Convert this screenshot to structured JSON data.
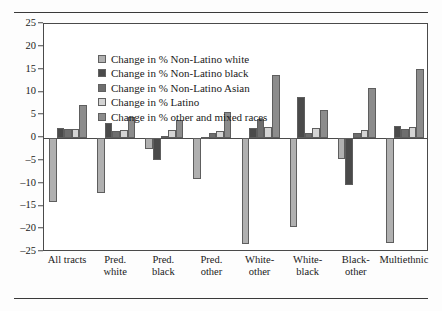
{
  "chart_data": {
    "type": "bar",
    "title": "",
    "xlabel": "",
    "ylabel": "",
    "ylim": [
      -25,
      25
    ],
    "ytick_step": 5,
    "yticks": [
      25,
      20,
      15,
      10,
      5,
      0,
      -5,
      -10,
      -15,
      -20,
      -25
    ],
    "ytick_labels": [
      "25",
      "20",
      "15",
      "10",
      "5",
      "0",
      "–5",
      "–10",
      "–15",
      "–20",
      "–25"
    ],
    "grid": false,
    "legend_position": "upper-left-inside",
    "categories": [
      "All tracts",
      "Pred.\nwhite",
      "Pred.\nblack",
      "Pred.\nother",
      "White-\nother",
      "White-\nblack",
      "Black-\nother",
      "Multiethnic"
    ],
    "series": [
      {
        "name": "Change in % Non-Latino white",
        "color": "#b0b0b0",
        "values": [
          -14.0,
          -12.0,
          -2.5,
          -9.0,
          -23.2,
          -19.5,
          -4.6,
          -23.0
        ]
      },
      {
        "name": "Change in % Non-Latino black",
        "color": "#4a4a4a",
        "values": [
          2.2,
          3.3,
          -4.8,
          0.2,
          2.2,
          8.9,
          -10.4,
          2.6
        ]
      },
      {
        "name": "Change in % Non-Latino Asian",
        "color": "#6e6e6e",
        "values": [
          2.0,
          1.6,
          0.4,
          1.0,
          4.1,
          1.1,
          1.0,
          2.0
        ]
      },
      {
        "name": "Change in % Latino",
        "color": "#d4d4d4",
        "values": [
          2.0,
          1.8,
          1.7,
          1.5,
          2.4,
          2.3,
          1.7,
          2.4
        ]
      },
      {
        "name": "Change in % other and mixed races",
        "color": "#8c8c8c",
        "values": [
          7.2,
          4.6,
          3.9,
          5.8,
          13.9,
          6.2,
          11.0,
          15.1
        ]
      }
    ]
  }
}
